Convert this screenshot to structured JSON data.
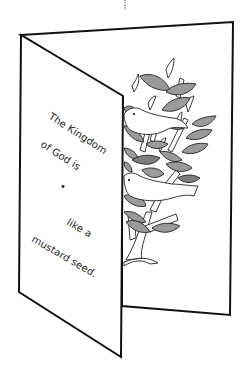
{
  "card": {
    "front_text": {
      "line1": "The Kingdom",
      "line2": "of God is",
      "line3": "like a",
      "line4": "mustard seed."
    },
    "blank_marker": "•"
  },
  "colors": {
    "background": "#ffffff",
    "outline": "#111111",
    "leaf_fill": "#9a9a9a",
    "leaf_dark_fill": "#7e7e7e",
    "bird_fill": "#ffffff",
    "fold_guide": "#666666"
  },
  "illustration": {
    "subject": "tree with leaves and two birds",
    "style": "grayscale line art"
  }
}
